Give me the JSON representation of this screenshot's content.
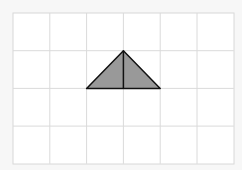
{
  "diagram": {
    "type": "grid-with-triangle",
    "grid": {
      "columns": 6,
      "rows": 4,
      "line_color": "#d8d8d8",
      "background": "#ffffff"
    },
    "triangle": {
      "vertices": [
        [
          3,
          1
        ],
        [
          2,
          2
        ],
        [
          4,
          2
        ]
      ],
      "altitude": [
        [
          3,
          1
        ],
        [
          3,
          2
        ]
      ],
      "fill": "#999999",
      "stroke": "#111111"
    }
  }
}
